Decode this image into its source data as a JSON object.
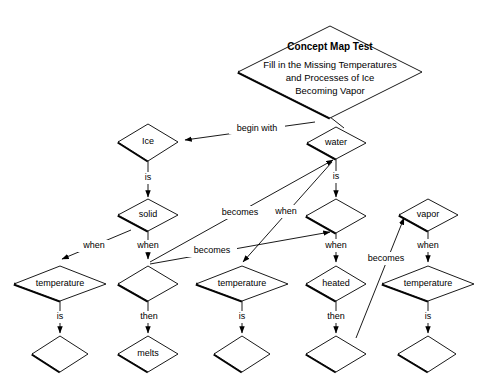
{
  "title": {
    "heading": "Concept Map Test",
    "line1": "Fill in the Missing Temperatures",
    "line2": "and Processes of Ice",
    "line3": "Becoming Vapor"
  },
  "colors": {
    "background": "#ffffff",
    "stroke": "#000000",
    "shadow": "#000000",
    "fill": "#ffffff"
  },
  "nodes": {
    "ice": "Ice",
    "water": "water",
    "solid": "solid",
    "vapor": "vapor",
    "temperature_left": "temperature",
    "temperature_center": "temperature",
    "temperature_right": "temperature",
    "heated": "heated",
    "melts": "melts",
    "blank_solid": "",
    "blank_water": "",
    "blank_left_answer": "",
    "blank_center_answer": "",
    "blank_heated_answer": "",
    "blank_vapor_answer": ""
  },
  "edges": {
    "begin_with": "begin with",
    "ice_is": "is",
    "water_is": "is",
    "solid_when_left": "when",
    "solid_when_down": "when",
    "becomes_to_water": "becomes",
    "when_to_center_temp": "when",
    "becomes_to_center_temp": "becomes",
    "when_to_water_blank": "when",
    "water_blank_when": "when",
    "vapor_when": "when",
    "becomes_to_vapor": "becomes",
    "left_temp_is": "is",
    "center_temp_is": "is",
    "right_temp_is": "is",
    "solid_blank_then": "then",
    "heated_then": "then"
  }
}
